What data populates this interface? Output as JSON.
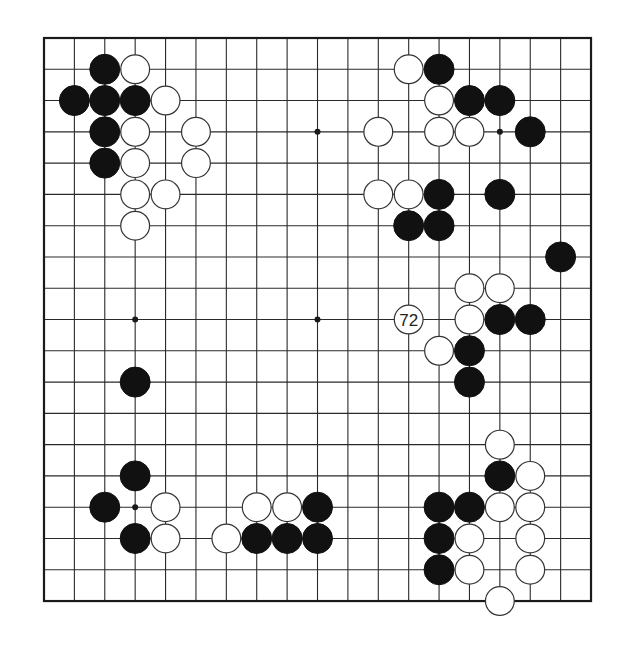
{
  "board": {
    "size": 19,
    "origin": {
      "x": 44,
      "y": 38
    },
    "spacing": {
      "x": 30.39,
      "y": 31.28
    },
    "stone_radius": 15,
    "colors": {
      "line": "#2a2a2a",
      "black": "#111111",
      "white": "#ffffff",
      "background": "#ffffff"
    },
    "hoshi": [
      [
        9,
        3
      ],
      [
        15,
        3
      ],
      [
        3,
        9
      ],
      [
        9,
        9
      ],
      [
        3,
        15
      ]
    ]
  },
  "stones": {
    "black": [
      [
        2,
        1
      ],
      [
        1,
        2
      ],
      [
        2,
        2
      ],
      [
        3,
        2
      ],
      [
        2,
        3
      ],
      [
        2,
        4
      ],
      [
        13,
        1
      ],
      [
        14,
        2
      ],
      [
        15,
        2
      ],
      [
        16,
        3
      ],
      [
        13,
        5
      ],
      [
        15,
        5
      ],
      [
        12,
        6
      ],
      [
        13,
        6
      ],
      [
        17,
        7
      ],
      [
        15,
        9
      ],
      [
        16,
        9
      ],
      [
        14,
        10
      ],
      [
        14,
        11
      ],
      [
        3,
        11
      ],
      [
        3,
        14
      ],
      [
        2,
        15
      ],
      [
        3,
        16
      ],
      [
        9,
        15
      ],
      [
        7,
        16
      ],
      [
        8,
        16
      ],
      [
        9,
        16
      ],
      [
        15,
        14
      ],
      [
        13,
        15
      ],
      [
        14,
        15
      ],
      [
        13,
        16
      ],
      [
        13,
        17
      ]
    ],
    "white": [
      [
        3,
        1
      ],
      [
        4,
        2
      ],
      [
        3,
        3
      ],
      [
        5,
        3
      ],
      [
        3,
        4
      ],
      [
        5,
        4
      ],
      [
        3,
        5
      ],
      [
        4,
        5
      ],
      [
        3,
        6
      ],
      [
        12,
        1
      ],
      [
        13,
        2
      ],
      [
        11,
        3
      ],
      [
        13,
        3
      ],
      [
        14,
        3
      ],
      [
        11,
        5
      ],
      [
        12,
        5
      ],
      [
        14,
        8
      ],
      [
        15,
        8
      ],
      [
        14,
        9
      ],
      [
        13,
        10
      ],
      [
        4,
        15
      ],
      [
        4,
        16
      ],
      [
        7,
        15
      ],
      [
        8,
        15
      ],
      [
        6,
        16
      ],
      [
        15,
        13
      ],
      [
        16,
        14
      ],
      [
        15,
        15
      ],
      [
        16,
        15
      ],
      [
        14,
        16
      ],
      [
        16,
        16
      ],
      [
        14,
        17
      ],
      [
        16,
        17
      ],
      [
        15,
        18
      ]
    ]
  },
  "labeled_stones": [
    {
      "color": "white",
      "col": 12,
      "row": 9,
      "label": "72"
    }
  ]
}
